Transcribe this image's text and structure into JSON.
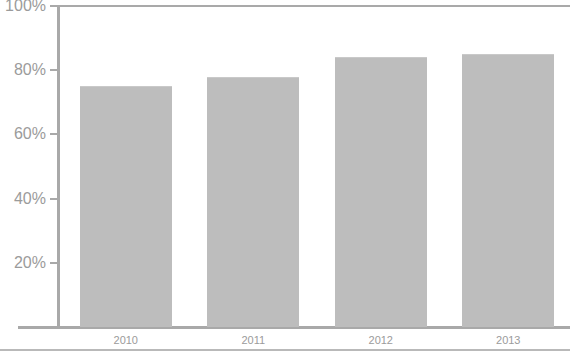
{
  "chart_data": {
    "type": "bar",
    "title": "",
    "xlabel": "",
    "ylabel": "",
    "categories": [
      "2010",
      "2011",
      "2012",
      "2013"
    ],
    "values": [
      75,
      78,
      84,
      85
    ],
    "value_labels": [
      "75%",
      "78%",
      "84%",
      "85%"
    ],
    "ylim": [
      0,
      100
    ],
    "ytick_values": [
      20,
      40,
      60,
      80,
      100
    ],
    "ytick_labels": [
      "20%",
      "40%",
      "60%",
      "80%",
      "100%"
    ],
    "grid": false,
    "legend": null,
    "series": [
      {
        "name": "",
        "values": [
          75,
          78,
          84,
          85
        ]
      }
    ],
    "colors": {
      "bar_fill": "#bdbdbd",
      "axis": "#a9a9a9",
      "tick_label": "#9b9b9b",
      "background": "#ffffff",
      "rule": "#b9b9b9"
    }
  },
  "axes": {
    "y_ticks": [
      {
        "label": "100%",
        "value": 100
      },
      {
        "label": "80%",
        "value": 80
      },
      {
        "label": "60%",
        "value": 60
      },
      {
        "label": "40%",
        "value": 40
      },
      {
        "label": "20%",
        "value": 20
      }
    ],
    "x_ticks": [
      {
        "label": "2010"
      },
      {
        "label": "2011"
      },
      {
        "label": "2012"
      },
      {
        "label": "2013"
      }
    ]
  },
  "title_strip": {
    "text": ""
  }
}
